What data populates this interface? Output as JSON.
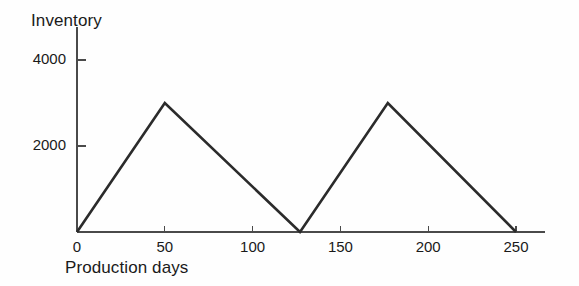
{
  "chart_data": {
    "type": "line",
    "title": "Inventory",
    "xlabel": "Production days",
    "ylabel": "Inventory",
    "xlim": [
      0,
      262
    ],
    "ylim": [
      0,
      4400
    ],
    "grid": false,
    "legend": "none",
    "x_ticks": [
      0,
      50,
      100,
      150,
      200,
      250
    ],
    "x_tick_labels": [
      "0",
      "50",
      "100",
      "150",
      "200",
      "250"
    ],
    "y_ticks": [
      2000,
      4000
    ],
    "y_tick_labels": [
      "2000",
      "4000"
    ],
    "series": [
      {
        "name": "Inventory level",
        "points": [
          {
            "x": 0,
            "y": 0
          },
          {
            "x": 50,
            "y": 3000
          },
          {
            "x": 127,
            "y": 0
          },
          {
            "x": 177,
            "y": 3000
          },
          {
            "x": 250,
            "y": 0
          }
        ]
      }
    ],
    "colors": {
      "line": "#2b2b2b",
      "axis": "#4a4a4a",
      "background": "#fefefe",
      "text": "#1a1a1a"
    }
  }
}
